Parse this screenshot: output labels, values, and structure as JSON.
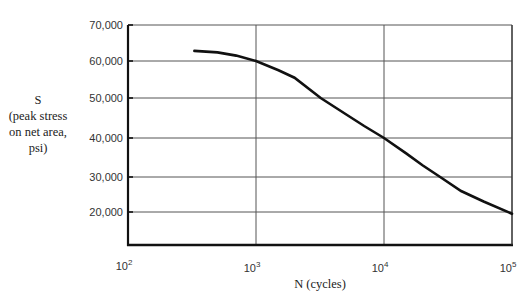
{
  "chart_data": {
    "type": "line",
    "title": "",
    "xlabel": "N (cycles)",
    "ylabel": [
      "S",
      "(peak stress",
      "on net area,",
      "psi)"
    ],
    "x_scale": "log",
    "xlim": [
      100,
      100000
    ],
    "ylim": [
      10000,
      70000
    ],
    "x_ticks": [
      {
        "base": "10",
        "exp": "2",
        "value": 100
      },
      {
        "base": "10",
        "exp": "3",
        "value": 1000
      },
      {
        "base": "10",
        "exp": "4",
        "value": 10000
      },
      {
        "base": "10",
        "exp": "5",
        "value": 100000
      }
    ],
    "y_ticks": [
      {
        "label": "70,000",
        "value": 70000
      },
      {
        "label": "60,000",
        "value": 60000
      },
      {
        "label": "50,000",
        "value": 50000
      },
      {
        "label": "40,000",
        "value": 40000
      },
      {
        "label": "30,000",
        "value": 30000
      },
      {
        "label": "20,000",
        "value": 20000
      }
    ],
    "grid": true,
    "legend": null,
    "series": [
      {
        "name": "S-N curve",
        "x": [
          330,
          500,
          700,
          1000,
          1500,
          2000,
          3200,
          5000,
          7000,
          10000,
          15000,
          20000,
          27500,
          40000,
          60000,
          100000
        ],
        "y": [
          62800,
          62400,
          61500,
          60000,
          57500,
          55500,
          50000,
          46000,
          43000,
          40000,
          36000,
          33000,
          30000,
          26000,
          23000,
          19500
        ]
      }
    ]
  }
}
